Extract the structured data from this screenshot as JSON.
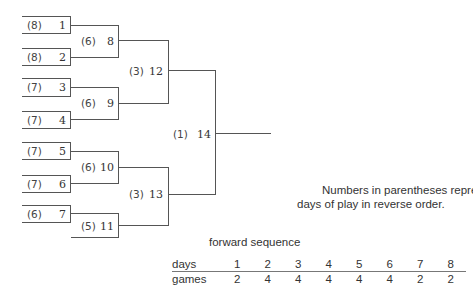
{
  "bracket": {
    "entries": [
      {
        "team": "1",
        "day": "(8)"
      },
      {
        "team": "2",
        "day": "(8)"
      },
      {
        "team": "3",
        "day": "(7)"
      },
      {
        "team": "4",
        "day": "(7)"
      },
      {
        "team": "5",
        "day": "(7)"
      },
      {
        "team": "6",
        "day": "(7)"
      },
      {
        "team": "7",
        "day": "(6)"
      }
    ],
    "games": [
      {
        "game": "8",
        "day": "(6)"
      },
      {
        "game": "9",
        "day": "(6)"
      },
      {
        "game": "10",
        "day": "(6)"
      },
      {
        "game": "11",
        "day": "(5)"
      },
      {
        "game": "12",
        "day": "(3)"
      },
      {
        "game": "13",
        "day": "(3)"
      },
      {
        "game": "14",
        "day": "(1)"
      }
    ]
  },
  "note": {
    "line1": "Numbers in parentheses represent",
    "line2": "days of play in reverse order."
  },
  "sequence": {
    "title": "forward sequence",
    "days_label": "days",
    "games_label": "games",
    "days": [
      "1",
      "2",
      "3",
      "4",
      "5",
      "6",
      "7",
      "8"
    ],
    "games": [
      "2",
      "4",
      "4",
      "4",
      "4",
      "4",
      "2",
      "2"
    ]
  }
}
